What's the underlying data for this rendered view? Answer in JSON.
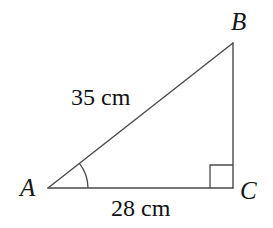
{
  "figure": {
    "kind": "right-triangle-diagram",
    "background_color": "#ffffff",
    "stroke_color": "#4a4a4a",
    "text_color": "#161616",
    "stroke_width": 1.4,
    "canvas": {
      "width": 273,
      "height": 228
    },
    "vertices": [
      {
        "name": "A",
        "label": "A",
        "x": 48,
        "y": 188
      },
      {
        "name": "B",
        "label": "B",
        "x": 233,
        "y": 43
      },
      {
        "name": "C",
        "label": "C",
        "x": 233,
        "y": 188
      }
    ],
    "sides": [
      {
        "name": "AB",
        "role": "hypotenuse",
        "label": "35 cm",
        "length": 35,
        "unit": "cm"
      },
      {
        "name": "AC",
        "role": "adjacent-base",
        "label": "28 cm",
        "length": 28,
        "unit": "cm"
      },
      {
        "name": "BC",
        "role": "opposite-vertical",
        "label": "",
        "length": null,
        "unit": "cm"
      }
    ],
    "markers": [
      {
        "name": "angle-arc-a",
        "at_vertex": "A",
        "type": "arc",
        "radius": 40
      },
      {
        "name": "right-angle-c",
        "at_vertex": "C",
        "type": "right-angle-square",
        "size": 23
      }
    ]
  },
  "labels": {
    "vertex_a": "A",
    "vertex_b": "B",
    "vertex_c": "C",
    "side_ab": "35 cm",
    "side_ac": "28 cm"
  }
}
